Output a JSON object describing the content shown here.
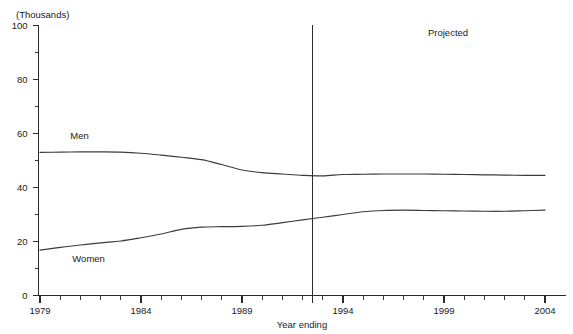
{
  "chart_data": {
    "type": "line",
    "title": "",
    "subtitle": "",
    "unit_label": "(Thousands)",
    "xlabel": "Year ending",
    "ylabel": "",
    "xlim": [
      1979,
      2004
    ],
    "ylim": [
      0,
      100
    ],
    "ytick_labels": [
      "0",
      "20",
      "40",
      "60",
      "80",
      "100"
    ],
    "ytick_values": [
      0,
      20,
      40,
      60,
      80,
      100
    ],
    "yminor_values": [
      10,
      30,
      50,
      70,
      90
    ],
    "xtick_labels": [
      "1979",
      "1984",
      "1989",
      "1994",
      "1999",
      "2004"
    ],
    "xtick_values": [
      1979,
      1984,
      1989,
      1994,
      1999,
      2004
    ],
    "grid": false,
    "legend_position": "inline-labels",
    "x": [
      1979,
      1980,
      1981,
      1982,
      1983,
      1984,
      1985,
      1986,
      1987,
      1988,
      1989,
      1990,
      1991,
      1992,
      1993,
      1994,
      1995,
      1996,
      1997,
      1998,
      1999,
      2000,
      2001,
      2002,
      2003,
      2004
    ],
    "series": [
      {
        "name": "Men",
        "label": "Men",
        "label_x": 1980.5,
        "label_y": 58,
        "color": "#3c3c3c",
        "values": [
          53.0,
          53.1,
          53.2,
          53.2,
          53.1,
          52.7,
          52.0,
          51.2,
          50.3,
          48.5,
          46.5,
          45.5,
          45.0,
          44.5,
          44.3,
          44.8,
          44.9,
          45.0,
          45.0,
          45.0,
          44.9,
          44.8,
          44.7,
          44.6,
          44.5,
          44.5
        ]
      },
      {
        "name": "Women",
        "label": "Women",
        "label_x": 1980.6,
        "label_y": 12.5,
        "color": "#3c3c3c",
        "values": [
          16.8,
          17.8,
          18.7,
          19.5,
          20.2,
          21.4,
          22.8,
          24.5,
          25.3,
          25.5,
          25.6,
          26.0,
          27.0,
          28.0,
          29.0,
          30.0,
          31.0,
          31.5,
          31.6,
          31.5,
          31.4,
          31.3,
          31.2,
          31.2,
          31.4,
          31.6
        ]
      }
    ],
    "annotations": [
      {
        "name": "projection-divider",
        "type": "vline",
        "x": 1992.45,
        "label": ""
      },
      {
        "name": "projected-label",
        "type": "text",
        "text": "Projected",
        "x": 1999.2,
        "y": 96
      }
    ]
  }
}
